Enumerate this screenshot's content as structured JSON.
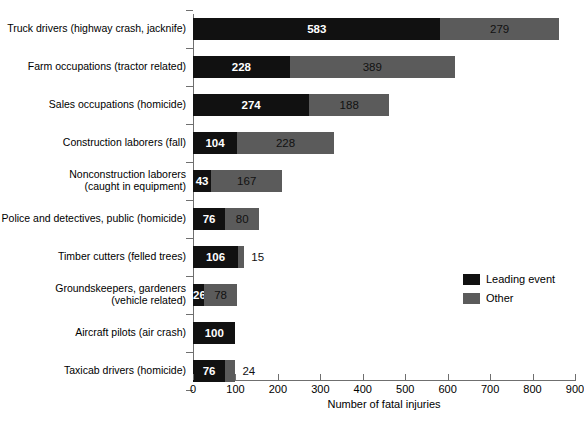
{
  "chart_data": {
    "type": "bar",
    "orientation": "horizontal",
    "stacked": true,
    "title": "",
    "xlabel": "Number of fatal injuries",
    "ylabel": "",
    "xlim": [
      0,
      900
    ],
    "xticks": [
      0,
      100,
      200,
      300,
      400,
      500,
      600,
      700,
      800,
      900
    ],
    "grid": false,
    "legend_position": "right-middle",
    "categories": [
      "Truck drivers (highway crash, jacknife)",
      "Farm occupations (tractor related)",
      "Sales occupations (homicide)",
      "Construction laborers (fall)",
      "Nonconstruction laborers\n(caught in equipment)",
      "Police and detectives, public (homicide)",
      "Timber cutters (felled trees)",
      "Groundskeepers, gardeners\n(vehicle related)",
      "Aircraft pilots (air crash)",
      "Taxicab drivers (homicide)"
    ],
    "series": [
      {
        "name": "Leading event",
        "color": "#111111",
        "values": [
          583,
          228,
          274,
          104,
          43,
          76,
          106,
          26,
          100,
          76
        ]
      },
      {
        "name": "Other",
        "color": "#5b5b5b",
        "values": [
          279,
          389,
          188,
          228,
          167,
          80,
          15,
          78,
          0,
          24
        ]
      }
    ],
    "bar_labels": {
      "leading": [
        "583",
        "228",
        "274",
        "104",
        "43",
        "76",
        "106",
        "26",
        "100",
        "76"
      ],
      "other": [
        "279",
        "389",
        "188",
        "228",
        "167",
        "80",
        "15",
        "78",
        "",
        "24"
      ]
    }
  },
  "axis": {
    "x_title": "Number of fatal injuries",
    "tick_labels": [
      "0",
      "100",
      "200",
      "300",
      "400",
      "500",
      "600",
      "700",
      "800",
      "900"
    ]
  },
  "legend": {
    "items": [
      {
        "label": "Leading event",
        "color": "#111111"
      },
      {
        "label": "Other",
        "color": "#5b5b5b"
      }
    ]
  }
}
